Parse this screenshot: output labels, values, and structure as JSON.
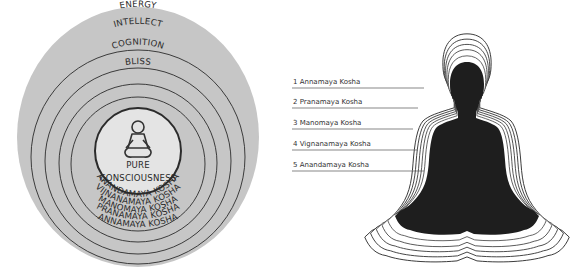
{
  "left_diagram": {
    "outer_labels": [
      "BODY",
      "ENERGY",
      "INTELLECT",
      "COGNITION",
      "BLISS"
    ],
    "center": {
      "icon": "meditating-person-icon",
      "label_line1": "PURE",
      "label_line2": "CONSCIOUSNESS"
    },
    "lower_labels": [
      "ANANDAMAYA KOSHA",
      "VIJNANAMAYA KOSHA",
      "MANOMAYA KOSHA",
      "PRANAMAYA KOSHA",
      "ANNAMAYA KOSHA"
    ],
    "colors": {
      "disc": "#c8c8c8",
      "center": "#e6e6e6",
      "ring_line": "#2b2b2b"
    }
  },
  "right_diagram": {
    "labels": [
      "1 Annamaya Kosha",
      "2 Pranamaya Kosha",
      "3 Manomaya Kosha",
      "4 Vignanamaya Kosha",
      "5 Anandamaya Kosha"
    ],
    "silhouette": "meditating-silhouette",
    "colors": {
      "silhouette": "#1e1e1e",
      "aura_line": "#333333"
    }
  }
}
